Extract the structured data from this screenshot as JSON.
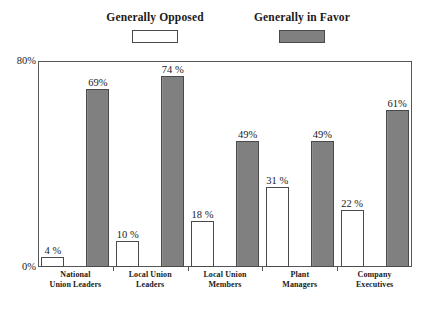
{
  "chart_data": {
    "type": "bar",
    "title": "",
    "subtitle": "",
    "xlabel": "",
    "ylabel": "",
    "ylim": [
      0,
      80
    ],
    "ytick_labels": [
      "0%",
      "80%"
    ],
    "ytick_values": [
      0,
      80
    ],
    "grid": false,
    "legend_position": "top",
    "value_suffix": "%",
    "categories": [
      "National\nUnion Leaders",
      "Local Union\nLeaders",
      "Local Union\nMembers",
      "Plant\nManagers",
      "Company\nExecutives"
    ],
    "categories_lines": [
      [
        "National",
        "Union Leaders"
      ],
      [
        "Local Union",
        "Leaders"
      ],
      [
        "Local Union",
        "Members"
      ],
      [
        "Plant",
        "Managers"
      ],
      [
        "Company",
        "Executives"
      ]
    ],
    "series": [
      {
        "name": "Generally Opposed",
        "color": "#ffffff",
        "border_color": "#4a4a4a",
        "values": [
          4,
          10,
          18,
          31,
          22
        ],
        "labels": [
          "4 %",
          "10 %",
          "18 %",
          "31 %",
          "22 %"
        ]
      },
      {
        "name": "Generally in Favor",
        "color": "#808080",
        "border_color": "#4a4a4a",
        "values": [
          69,
          74,
          49,
          49,
          61
        ],
        "labels": [
          "69%",
          "74 %",
          "49%",
          "49%",
          "61%"
        ]
      }
    ]
  },
  "legend": {
    "opposed_label": "Generally Opposed",
    "favor_label": "Generally in Favor"
  },
  "axis": {
    "y_top_label": "80%",
    "y_bottom_label": "0%"
  },
  "colors": {
    "favor_fill": "#808080",
    "opposed_fill": "#ffffff",
    "frame": "#55565a",
    "bar_border": "#4a4a4a",
    "text": "#1a1a1a"
  }
}
